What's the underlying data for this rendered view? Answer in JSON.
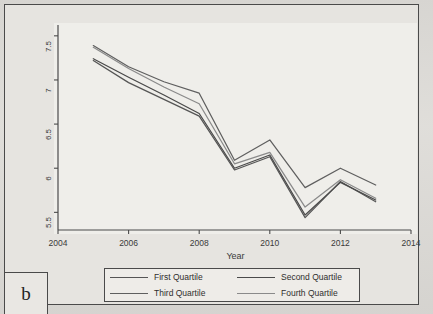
{
  "figure": {
    "panel_label": "b",
    "background_color": "#e6e4e0",
    "frame_color": "#4a4a4a"
  },
  "chart_data": {
    "type": "line",
    "title": "",
    "xlabel": "Year",
    "ylabel": "CO2 emissions per capita (tons)",
    "xlim": [
      2004,
      2014
    ],
    "ylim": [
      5.3,
      7.6
    ],
    "xticks": [
      2004,
      2006,
      2008,
      2010,
      2012,
      2014
    ],
    "xtick_labels": [
      "2004",
      "2006",
      "2008",
      "2010",
      "2012",
      "2014"
    ],
    "yticks": [
      5.5,
      6,
      6.5,
      7,
      7.5
    ],
    "ytick_labels": [
      "5.5",
      "6",
      "6.5",
      "7",
      "7.5"
    ],
    "grid": false,
    "legend_position": "below-center",
    "x": [
      2005,
      2006,
      2007,
      2008,
      2009,
      2010,
      2011,
      2012,
      2013
    ],
    "series": [
      {
        "name": "First Quartile",
        "color": "#555555",
        "values": [
          7.22,
          6.97,
          6.78,
          6.59,
          5.98,
          6.13,
          5.44,
          5.85,
          5.62
        ]
      },
      {
        "name": "Second Quartile",
        "color": "#4a4a4a",
        "values": [
          7.24,
          7.03,
          6.83,
          6.62,
          6.0,
          6.15,
          5.47,
          5.84,
          5.64
        ]
      },
      {
        "name": "Third Quartile",
        "color": "#5f5f5f",
        "values": [
          7.39,
          7.15,
          6.98,
          6.85,
          6.09,
          6.32,
          5.78,
          6.0,
          5.81
        ]
      },
      {
        "name": "Fourth Quartile",
        "color": "#8a8a8a",
        "values": [
          7.37,
          7.13,
          6.92,
          6.73,
          6.05,
          6.18,
          5.56,
          5.87,
          5.66
        ]
      }
    ]
  },
  "legend": {
    "entries": [
      {
        "label": "First Quartile"
      },
      {
        "label": "Second Quartile"
      },
      {
        "label": "Third Quartile"
      },
      {
        "label": "Fourth Quartile"
      }
    ]
  }
}
